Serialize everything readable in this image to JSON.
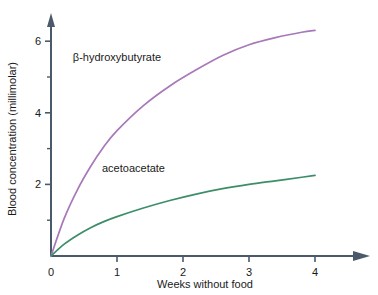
{
  "chart_data": {
    "type": "line",
    "title": "",
    "subtitle": "",
    "xlabel": "Weeks without food",
    "ylabel": "Blood concentration (millimolar)",
    "xlim": [
      0,
      4.6
    ],
    "ylim": [
      0,
      6.7
    ],
    "grid": false,
    "legend_position": "inline-annotation",
    "x_ticks": [
      0,
      1,
      2,
      3,
      4
    ],
    "x_tick_labels": [
      "0",
      "1",
      "2",
      "3",
      "4"
    ],
    "y_ticks_major": [
      2,
      4,
      6
    ],
    "y_tick_labels": [
      "2",
      "4",
      "6"
    ],
    "y_ticks_minor": [
      1,
      3,
      5
    ],
    "x": [
      0,
      0.2,
      0.4,
      0.6,
      0.8,
      1.0,
      1.4,
      1.8,
      2.2,
      2.6,
      3.0,
      3.4,
      3.8,
      4.0
    ],
    "series": [
      {
        "name": "β-hydroxybutyrate",
        "color": "#a878b8",
        "label_text": "β-hydroxybutyrate",
        "values": [
          0,
          1.05,
          1.85,
          2.5,
          3.05,
          3.5,
          4.2,
          4.75,
          5.2,
          5.6,
          5.9,
          6.1,
          6.25,
          6.3
        ]
      },
      {
        "name": "acetoacetate",
        "color": "#3d8e68",
        "label_text": "acetoacetate",
        "values": [
          0,
          0.33,
          0.58,
          0.79,
          0.96,
          1.1,
          1.34,
          1.55,
          1.73,
          1.88,
          2.0,
          2.1,
          2.2,
          2.25
        ]
      }
    ],
    "annotations": [
      {
        "text": "β-hydroxybutyrate",
        "x": 1.0,
        "y": 5.45
      },
      {
        "text": "acetoacetate",
        "x": 1.25,
        "y": 2.35
      }
    ],
    "axis_color": "#4a5a6a",
    "background_color": "#ffffff"
  }
}
